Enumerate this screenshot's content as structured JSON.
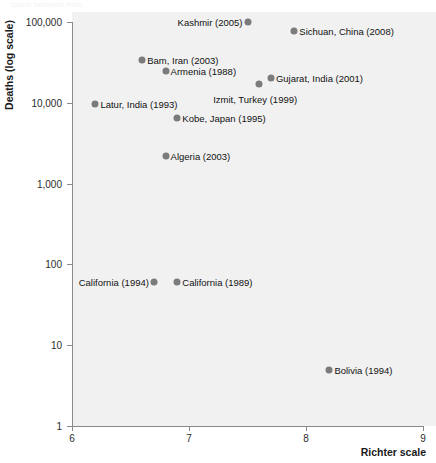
{
  "top_cropped_text": "space between lines",
  "chart_data": {
    "type": "scatter",
    "title": "",
    "xlabel": "Richter scale",
    "ylabel": "Deaths (log scale)",
    "xlim": [
      6,
      9
    ],
    "ylim": [
      1,
      100000
    ],
    "yscale": "log",
    "grid": false,
    "legend": "none",
    "xticks": [
      "6",
      "7",
      "8",
      "9"
    ],
    "xtick_values": [
      6,
      7,
      8,
      9
    ],
    "yticks": [
      "1",
      "10",
      "100",
      "1,000",
      "10,000",
      "100,000"
    ],
    "ytick_values": [
      1,
      10,
      100,
      1000,
      10000,
      100000
    ],
    "marker_color": "#7b7b7b",
    "plot_background": "#f1f1f1",
    "axis_color": "#8a8a8a",
    "points": [
      {
        "label": "Kashmir (2005)",
        "x": 7.5,
        "y": 100000,
        "label_side": "left"
      },
      {
        "label": "Sichuan, China (2008)",
        "x": 7.9,
        "y": 77000,
        "label_side": "right"
      },
      {
        "label": "Bam, Iran (2003)",
        "x": 6.6,
        "y": 34000,
        "label_side": "right"
      },
      {
        "label": "Armenia (1988)",
        "x": 6.8,
        "y": 25000,
        "label_side": "right"
      },
      {
        "label": "Gujarat, India (2001)",
        "x": 7.7,
        "y": 20000,
        "label_side": "right"
      },
      {
        "label": "Izmit, Turkey (1999)",
        "x": 7.6,
        "y": 17000,
        "label_side": "below"
      },
      {
        "label": "Latur, India (1993)",
        "x": 6.2,
        "y": 9700,
        "label_side": "right"
      },
      {
        "label": "Kobe, Japan (1995)",
        "x": 6.9,
        "y": 6400,
        "label_side": "right"
      },
      {
        "label": "Algeria (2003)",
        "x": 6.8,
        "y": 2200,
        "label_side": "right"
      },
      {
        "label": "California (1994)",
        "x": 6.7,
        "y": 60,
        "label_side": "left"
      },
      {
        "label": "California (1989)",
        "x": 6.9,
        "y": 60,
        "label_side": "right"
      },
      {
        "label": "Bolivia (1994)",
        "x": 8.2,
        "y": 5,
        "label_side": "right"
      }
    ]
  }
}
